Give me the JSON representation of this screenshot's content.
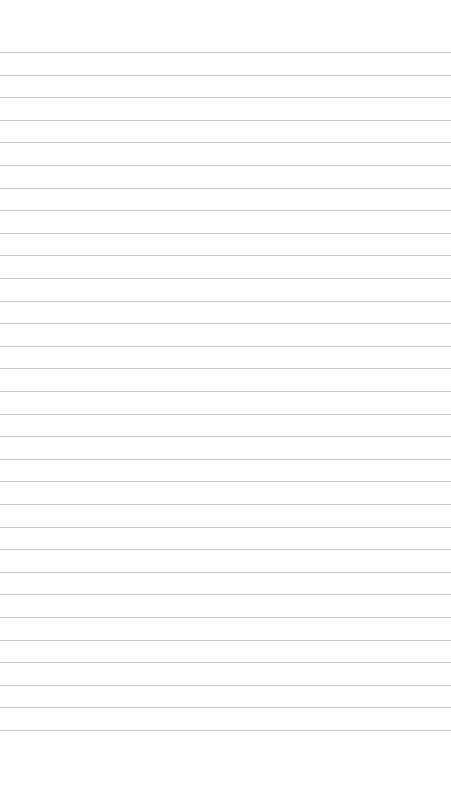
{
  "paper": {
    "background": "#ffffff",
    "line_color": "#c9c9c9",
    "first_line_y": 52,
    "line_spacing": 22.6,
    "line_count": 31
  }
}
